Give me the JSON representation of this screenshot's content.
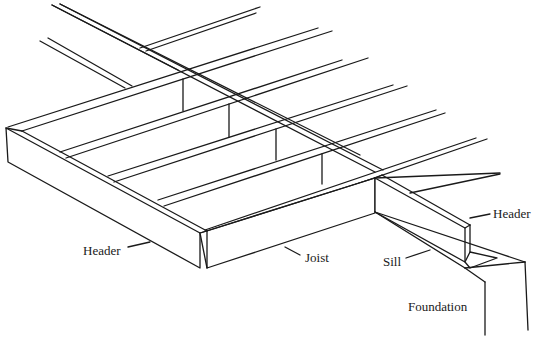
{
  "diagram": {
    "title": "",
    "labels": {
      "header_left": "Header",
      "joist": "Joist",
      "sill": "Sill",
      "header_right": "Header",
      "foundation": "Foundation"
    },
    "colors": {
      "line": "#1a1a1a",
      "background": "#ffffff"
    }
  }
}
